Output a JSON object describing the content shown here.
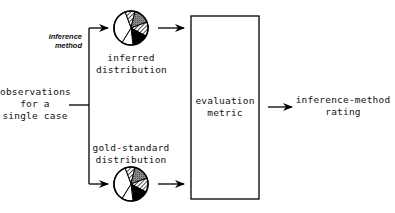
{
  "diagram": {
    "input_label_lines": [
      "observations",
      "for a",
      "single case"
    ],
    "branch_label_lines": [
      "inference",
      "method"
    ],
    "inferred_label_lines": [
      "inferred",
      "distribution"
    ],
    "gold_label_lines": [
      "gold-standard",
      "distribution"
    ],
    "metric_label_lines": [
      "evaluation",
      "metric"
    ],
    "output_label_lines": [
      "inference-method",
      "rating"
    ]
  }
}
